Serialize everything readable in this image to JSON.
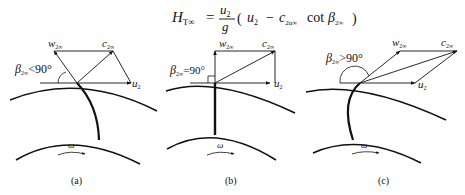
{
  "formula": {
    "lhs_symbol": "H",
    "lhs_subscript": "T∞",
    "equals": "=",
    "fraction_numerator": "u",
    "fraction_numerator_sub": "2",
    "fraction_denominator": "g",
    "paren_open": "(",
    "term1": "u",
    "term1_sub": "2",
    "minus": "−",
    "term2": "c",
    "term2_sub": "2u∞",
    "func": "cot",
    "beta": "β",
    "beta_sub": "2∞",
    "paren_close": ")"
  },
  "panels": [
    {
      "caption": "(a)",
      "angle_label": "β",
      "angle_sub": "2∞",
      "angle_relation": "<90°",
      "w_label": "w",
      "w_sub": "2∞",
      "c_label": "c",
      "c_sub": "2∞",
      "u_label": "u",
      "u_sub": "2",
      "omega": "ω"
    },
    {
      "caption": "(b)",
      "angle_label": "β",
      "angle_sub": "2∞",
      "angle_relation": "=90°",
      "w_label": "w",
      "w_sub": "2∞",
      "c_label": "c",
      "c_sub": "2∞",
      "u_label": "u",
      "u_sub": "2",
      "omega": "ω"
    },
    {
      "caption": "(c)",
      "angle_label": "β",
      "angle_sub": "2∞",
      "angle_relation": ">90°",
      "w_label": "w",
      "w_sub": "2∞",
      "c_label": "c",
      "c_sub": "2∞",
      "u_label": "u",
      "u_sub": "2",
      "omega": "ω"
    }
  ]
}
